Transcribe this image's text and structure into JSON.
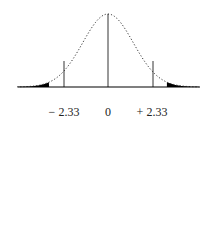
{
  "chart_data": {
    "type": "area",
    "title": "",
    "xlabel": "",
    "ylabel": "",
    "distribution": "normal",
    "mean": 0,
    "sd": 1,
    "shaded_regions": [
      {
        "from": "-inf",
        "to": -2.33,
        "color": "#000000"
      },
      {
        "from": 2.33,
        "to": "inf",
        "color": "#000000"
      }
    ],
    "vertical_lines": [
      0
    ],
    "tick_labels": [
      "− 2.33",
      "0",
      "+ 2.33"
    ],
    "tick_values": [
      -2.33,
      0,
      2.33
    ],
    "xlim": [
      -3.6,
      3.6
    ],
    "grid": false,
    "legend": null
  },
  "labels": {
    "left": "− 2.33",
    "center": "0",
    "right": "+ 2.33"
  },
  "colors": {
    "curve": "#333333",
    "fill": "#000000",
    "axis": "#000000"
  }
}
